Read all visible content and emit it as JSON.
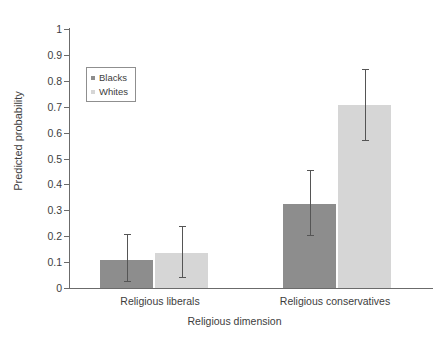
{
  "chart_data": {
    "type": "bar",
    "title": "",
    "xlabel": "Religious dimension",
    "ylabel": "Predicted probability",
    "categories": [
      "Religious liberals",
      "Religious conservatives"
    ],
    "ylim": [
      0,
      1
    ],
    "yticks": [
      "0",
      "0.1",
      "0.2",
      "0.3",
      "0.4",
      "0.5",
      "0.6",
      "0.7",
      "0.8",
      "0.9",
      "1"
    ],
    "grid": false,
    "legend_position": "upper-left-inside",
    "series": [
      {
        "name": "Blacks",
        "color": "#8d8d8d",
        "values": [
          0.11,
          0.325
        ],
        "error_low": [
          0.027,
          0.205
        ],
        "error_high": [
          0.21,
          0.455
        ]
      },
      {
        "name": "Whites",
        "color": "#d6d6d6",
        "values": [
          0.135,
          0.705
        ],
        "error_low": [
          0.042,
          0.57
        ],
        "error_high": [
          0.24,
          0.845
        ]
      }
    ]
  },
  "legend": {
    "items": [
      {
        "label": "Blacks",
        "swatch": "blacks"
      },
      {
        "label": "Whites",
        "swatch": "whites"
      }
    ]
  }
}
